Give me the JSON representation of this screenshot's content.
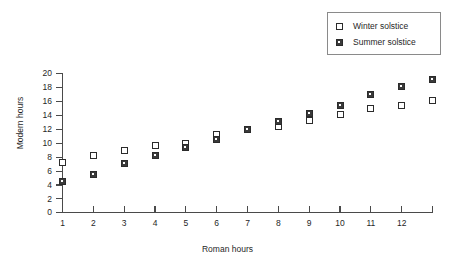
{
  "chart_data": {
    "type": "scatter",
    "title": "",
    "xlabel": "Roman hours",
    "ylabel": "Modern hours",
    "x": [
      1,
      2,
      3,
      4,
      5,
      6,
      7,
      8,
      9,
      10,
      11,
      12,
      13
    ],
    "categories": [
      "1",
      "2",
      "3",
      "4",
      "5",
      "6",
      "7",
      "8",
      "9",
      "10",
      "11",
      "12",
      ""
    ],
    "xtick_labels": [
      "1",
      "2",
      "3",
      "4",
      "5",
      "6",
      "7",
      "8",
      "9",
      "10",
      "11",
      "12"
    ],
    "ytick_labels": [
      "0",
      "2",
      "4",
      "6",
      "8",
      "10",
      "12",
      "14",
      "16",
      "18",
      "20"
    ],
    "xlim": [
      1,
      13
    ],
    "ylim": [
      0,
      20
    ],
    "grid": false,
    "legend_position": "top-right",
    "series": [
      {
        "name": "Winter solstice",
        "marker": "open-square",
        "values": [
          7.2,
          8.2,
          9.0,
          9.6,
          10.0,
          11.2,
          12.0,
          12.4,
          13.2,
          14.1,
          15.0,
          15.4,
          16.2
        ]
      },
      {
        "name": "Summer solstice",
        "marker": "hatched-square",
        "values": [
          4.4,
          5.5,
          7.0,
          8.2,
          9.4,
          10.5,
          12.0,
          13.1,
          14.3,
          15.4,
          17.0,
          18.1,
          19.2
        ]
      }
    ]
  },
  "legend": {
    "items": [
      {
        "label": "Winter solstice",
        "swatch": "open-square-icon"
      },
      {
        "label": "Summer solstice",
        "swatch": "hatched-square-icon"
      }
    ]
  },
  "colors": {
    "marker_stroke": "#2b2b2b",
    "hatch": "#3a3a3a",
    "axis": "#4a4a4a",
    "text": "#1f1f1f",
    "background": "#ffffff"
  }
}
